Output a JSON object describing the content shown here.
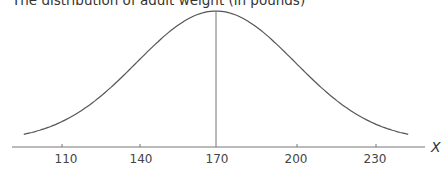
{
  "chart_data": {
    "type": "line",
    "title": "The distribution of adult weight (in pounds)",
    "xlabel": "X",
    "ylabel": "",
    "x_ticks": [
      110,
      140,
      170,
      200,
      230
    ],
    "x_tick_labels": [
      "110",
      "140",
      "170",
      "200",
      "230"
    ],
    "xlim": [
      93,
      246
    ],
    "grid": false,
    "legend": null,
    "series": [
      {
        "name": "Normal distribution",
        "mean": 170,
        "sd": 30,
        "x": [
          100,
          110,
          120,
          130,
          140,
          150,
          160,
          170,
          180,
          190,
          200,
          210,
          220,
          230,
          240
        ],
        "values": [
          0.0009,
          0.0018,
          0.0033,
          0.0055,
          0.0081,
          0.0106,
          0.0126,
          0.0133,
          0.0126,
          0.0106,
          0.0081,
          0.0055,
          0.0033,
          0.0018,
          0.0009
        ]
      }
    ],
    "annotations": [
      "vertical line at mean 170"
    ]
  },
  "labels": {
    "title": "The distribution of adult weight (in pounds)",
    "axis_x": "X",
    "ticks": [
      "110",
      "140",
      "170",
      "200",
      "230"
    ]
  }
}
